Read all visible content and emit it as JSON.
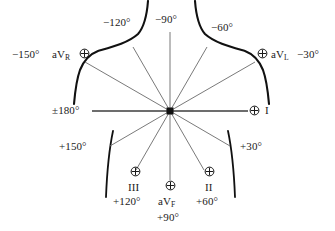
{
  "diagram": {
    "name": "hexaxial-reference-system",
    "stroke_color": "#111111",
    "axis_color": "#6a6a6a",
    "text_color": "#1a1a1a",
    "background": "#ffffff"
  },
  "center": {
    "x": 170,
    "y": 111,
    "marker": "filled-square"
  },
  "labels": {
    "top_left_angle": "−120°",
    "top_center_angle": "−90°",
    "top_right_angle": "−60°",
    "left_avr_angle": "−150°",
    "left_avr_lead": "aV",
    "left_avr_sub": "R",
    "right_avl_lead": "aV",
    "right_avl_sub": "L",
    "right_avl_angle": "−30°",
    "left_mid_angle": "±180°",
    "right_mid_lead": "I",
    "lower_left_angle": "+150°",
    "lower_right_angle": "+30°",
    "lead_three": "III",
    "lead_three_angle": "+120°",
    "lead_avf": "aV",
    "lead_avf_sub": "F",
    "lead_avf_angle": "+90°",
    "lead_two": "II",
    "lead_two_angle": "+60°"
  },
  "icons": {
    "positive_pole": "circled-plus-icon"
  },
  "axes": [
    {
      "name": "lead-I-axis",
      "angle_deg": 0,
      "label": "I",
      "positive_angle": "0°"
    },
    {
      "name": "lead-II-axis",
      "angle_deg": 60,
      "label": "II",
      "positive_angle": "+60°"
    },
    {
      "name": "lead-III-axis",
      "angle_deg": 120,
      "label": "III",
      "positive_angle": "+120°"
    },
    {
      "name": "lead-aVR-axis",
      "angle_deg": 210,
      "label": "aVR",
      "positive_angle": "−150°"
    },
    {
      "name": "lead-aVL-axis",
      "angle_deg": 330,
      "label": "aVL",
      "positive_angle": "−30°"
    },
    {
      "name": "lead-aVF-axis",
      "angle_deg": 90,
      "label": "aVF",
      "positive_angle": "+90°"
    }
  ],
  "angle_ticks": [
    "−120°",
    "−90°",
    "−60°",
    "−150°",
    "−30°",
    "±180°",
    "+150°",
    "+30°",
    "+120°",
    "+90°",
    "+60°"
  ]
}
